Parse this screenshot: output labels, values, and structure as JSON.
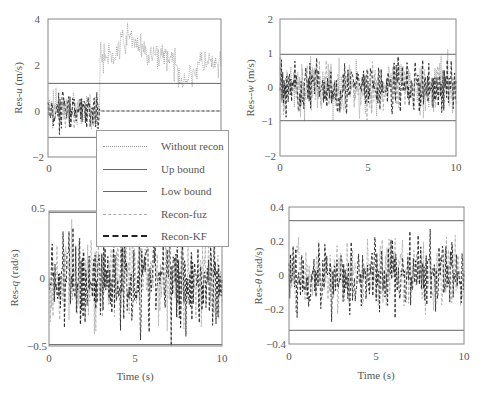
{
  "chart_data": [
    {
      "type": "line",
      "panel": "top-left",
      "title": "",
      "xlabel": "",
      "ylabel": "Res-u (m/s)",
      "xlim": [
        0,
        10
      ],
      "ylim": [
        -2,
        4
      ],
      "xticks": [
        "0"
      ],
      "yticks": [
        "-2",
        "0",
        "2",
        "4"
      ],
      "grid": false,
      "bounds": {
        "up": 1.2,
        "low": -1.15
      },
      "series": [
        {
          "name": "Without recon",
          "description": "noise around 0 until t≈3s, then jumps to ~2-3.5 (drifting, peaks ~3.3 at t≈5 and t≈8)"
        },
        {
          "name": "Up bound",
          "value": 1.2
        },
        {
          "name": "Low bound",
          "value": -1.15
        },
        {
          "name": "Recon-fuz",
          "description": "noise around 0 until t≈3s, then 0"
        },
        {
          "name": "Recon-KF",
          "description": "noise around 0 until t≈3s, jumps at t≈3 then flat 0"
        }
      ]
    },
    {
      "type": "line",
      "panel": "top-right",
      "xlabel": "",
      "ylabel": "Res-w (m/s)",
      "xlim": [
        0,
        10
      ],
      "ylim": [
        -2,
        2
      ],
      "xticks": [
        "0",
        "5",
        "10"
      ],
      "yticks": [
        "-2",
        "-1",
        "0",
        "1",
        "2"
      ],
      "grid": false,
      "bounds": {
        "up": 0.97,
        "low": -0.97
      },
      "series": [
        {
          "name": "Without recon",
          "description": "noise within ~[-1.2, 1.1]"
        },
        {
          "name": "Recon-fuz",
          "description": "noise within ~[-1, 1]"
        },
        {
          "name": "Recon-KF",
          "description": "noise within ~[-1.3, 1.1]"
        }
      ]
    },
    {
      "type": "line",
      "panel": "bottom-left",
      "xlabel": "Time (s)",
      "ylabel": "Res-q (rad/s)",
      "xlim": [
        0,
        10
      ],
      "ylim": [
        -0.5,
        0.5
      ],
      "xticks": [
        "0",
        "5",
        "10"
      ],
      "yticks": [
        "-0.5",
        "0",
        "0.5"
      ],
      "grid": false,
      "bounds": {
        "up": 0.49,
        "low": -0.49
      },
      "series": [
        {
          "name": "Recon-fuz",
          "description": "noise within ~[-0.4, 0.4]"
        },
        {
          "name": "Recon-KF",
          "description": "noise within ~[-0.5, 0.48], spikes near t≈1.5 and t≈4.9"
        }
      ]
    },
    {
      "type": "line",
      "panel": "bottom-right",
      "xlabel": "Time (s)",
      "ylabel": "Res-θ (rad/s)",
      "xlim": [
        0,
        10
      ],
      "ylim": [
        -0.4,
        0.4
      ],
      "xticks": [
        "0",
        "5",
        "10"
      ],
      "yticks": [
        "-0.4",
        "-0.2",
        "0",
        "0.2",
        "0.4"
      ],
      "grid": false,
      "bounds": {
        "up": 0.32,
        "low": -0.32
      },
      "series": [
        {
          "name": "Recon-fuz",
          "description": "noise within ~[-0.3, 0.3]"
        },
        {
          "name": "Recon-KF",
          "description": "noise within ~[-0.35, 0.32]"
        }
      ]
    }
  ],
  "legend": {
    "items": [
      {
        "label": "Without recon",
        "style": "dotted",
        "color": "#999999"
      },
      {
        "label": "Up bound",
        "style": "solid",
        "color": "#555555"
      },
      {
        "label": "Low bound",
        "style": "solid",
        "color": "#555555"
      },
      {
        "label": "Recon-fuz",
        "style": "dashed",
        "color": "#aaaaaa"
      },
      {
        "label": "Recon-KF",
        "style": "dashed",
        "color": "#222222"
      }
    ]
  },
  "labels": {
    "tl_ylabel": "Res-",
    "tl_yvar": "u",
    "tl_yunit": " (m/s)",
    "tr_ylabel": "Res--",
    "tr_yvar": "w",
    "tr_yunit": " (m/s)",
    "bl_ylabel": "Res-",
    "bl_yvar": "q",
    "bl_yunit": " (rad/s)",
    "br_ylabel": "Res-",
    "br_yvar": "θ",
    "br_yunit": " (rad/s)",
    "xlabel": "Time (s)",
    "tl_yticks": [
      "4",
      "2",
      "0",
      "−2"
    ],
    "tl_xticks": [
      "0"
    ],
    "tr_yticks": [
      "2",
      "1",
      "0",
      "−1",
      "−2"
    ],
    "tr_xticks": [
      "0",
      "5",
      "10"
    ],
    "bl_yticks": [
      "0.5",
      "0",
      "−0.5"
    ],
    "bl_xticks": [
      "0",
      "5",
      "10"
    ],
    "br_yticks": [
      "0.4",
      "0.2",
      "0",
      "−0.2",
      "−0.4"
    ],
    "br_xticks": [
      "0",
      "5",
      "10"
    ]
  }
}
